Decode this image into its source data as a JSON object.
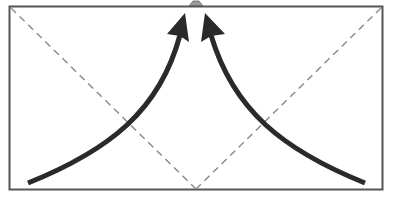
{
  "diagram": {
    "type": "origami-fold-instruction",
    "colors": {
      "background": "#ffffff",
      "paper_outline": "#555555",
      "fold_line": "#888888",
      "arrow": "#2a2a2a",
      "top_marker": "#9a9a9a"
    },
    "paper": {
      "x": 9,
      "y": 6,
      "width": 374,
      "height": 184
    },
    "fold_lines": [
      {
        "style": "dashed",
        "from": [
          10,
          7
        ],
        "to": [
          196,
          190
        ]
      },
      {
        "style": "dashed",
        "from": [
          382,
          7
        ],
        "to": [
          196,
          190
        ]
      }
    ],
    "arrows": [
      {
        "name": "left-fold-arrow",
        "from": [
          28,
          183
        ],
        "to": [
          183,
          18
        ]
      },
      {
        "name": "right-fold-arrow",
        "from": [
          365,
          183
        ],
        "to": [
          206,
          18
        ]
      }
    ],
    "top_marker": {
      "x": 196,
      "y": 6
    }
  }
}
